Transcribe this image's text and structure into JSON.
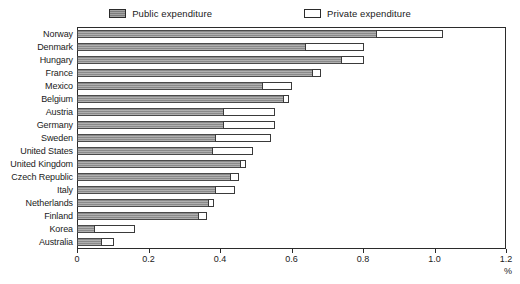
{
  "legend": {
    "items": [
      {
        "label": "Public expenditure",
        "swatch": "public-swatch",
        "color": "#8a8a8a"
      },
      {
        "label": "Private expenditure",
        "swatch": "private-swatch",
        "color": "#ffffff"
      }
    ]
  },
  "axis": {
    "unit_label": "%",
    "tick_labels": [
      "0",
      "0.2",
      "0.4",
      "0.6",
      "0.8",
      "1.0",
      "1.2"
    ],
    "tick_values": [
      0,
      0.2,
      0.4,
      0.6,
      0.8,
      1.0,
      1.2
    ]
  },
  "chart_data": {
    "type": "bar",
    "orientation": "horizontal",
    "stacked": true,
    "title": "",
    "xlabel": "%",
    "ylabel": "",
    "xlim": [
      0,
      1.2
    ],
    "grid": false,
    "legend_position": "top-center",
    "categories": [
      "Norway",
      "Denmark",
      "Hungary",
      "France",
      "Mexico",
      "Belgium",
      "Austria",
      "Germany",
      "Sweden",
      "United States",
      "United Kingdom",
      "Czech Republic",
      "Italy",
      "Netherlands",
      "Finland",
      "Korea",
      "Australia"
    ],
    "series": [
      {
        "name": "Public expenditure",
        "color": "#8a8a8a",
        "values": [
          0.84,
          0.64,
          0.74,
          0.66,
          0.52,
          0.58,
          0.41,
          0.41,
          0.39,
          0.38,
          0.46,
          0.43,
          0.39,
          0.37,
          0.34,
          0.05,
          0.07
        ]
      },
      {
        "name": "Private expenditure",
        "color": "#ffffff",
        "values": [
          0.18,
          0.16,
          0.06,
          0.02,
          0.08,
          0.01,
          0.14,
          0.14,
          0.15,
          0.11,
          0.01,
          0.02,
          0.05,
          0.01,
          0.02,
          0.11,
          0.03
        ]
      }
    ],
    "totals": [
      1.02,
      0.8,
      0.8,
      0.68,
      0.6,
      0.59,
      0.55,
      0.55,
      0.54,
      0.49,
      0.47,
      0.45,
      0.44,
      0.38,
      0.36,
      0.16,
      0.1
    ]
  }
}
